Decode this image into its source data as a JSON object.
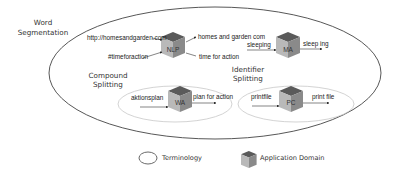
{
  "diagram": {
    "outer": {
      "label_line1": "Word",
      "label_line2": "Segmentation"
    },
    "compound": {
      "label_line1": "Compound",
      "label_line2": "Splitting"
    },
    "identifier": {
      "label_line1": "Identifier",
      "label_line2": "Splitting"
    },
    "nodes": [
      {
        "cube": "NLP",
        "inputs": [
          "http://homesandgarden.com",
          "#timeforaction"
        ],
        "outputs": [
          "homes and garden com",
          "time for action"
        ]
      },
      {
        "cube": "MA",
        "inputs": [
          "sleeping"
        ],
        "outputs": [
          "sleep ing"
        ]
      },
      {
        "cube": "WA",
        "inputs": [
          "aktionsplan"
        ],
        "outputs": [
          "plan for action"
        ]
      },
      {
        "cube": "PC",
        "inputs": [
          "printfile"
        ],
        "outputs": [
          "print file"
        ]
      }
    ]
  },
  "legend": {
    "terminology": "Terminology",
    "application_domain": "Application Domain"
  },
  "colors": {
    "outer_stroke": "#444444",
    "inner_stroke": "#c8c8c8",
    "cube_top": "#5a5a5a",
    "cube_left": "#b9b9b9",
    "cube_right": "#8a8a8a"
  }
}
